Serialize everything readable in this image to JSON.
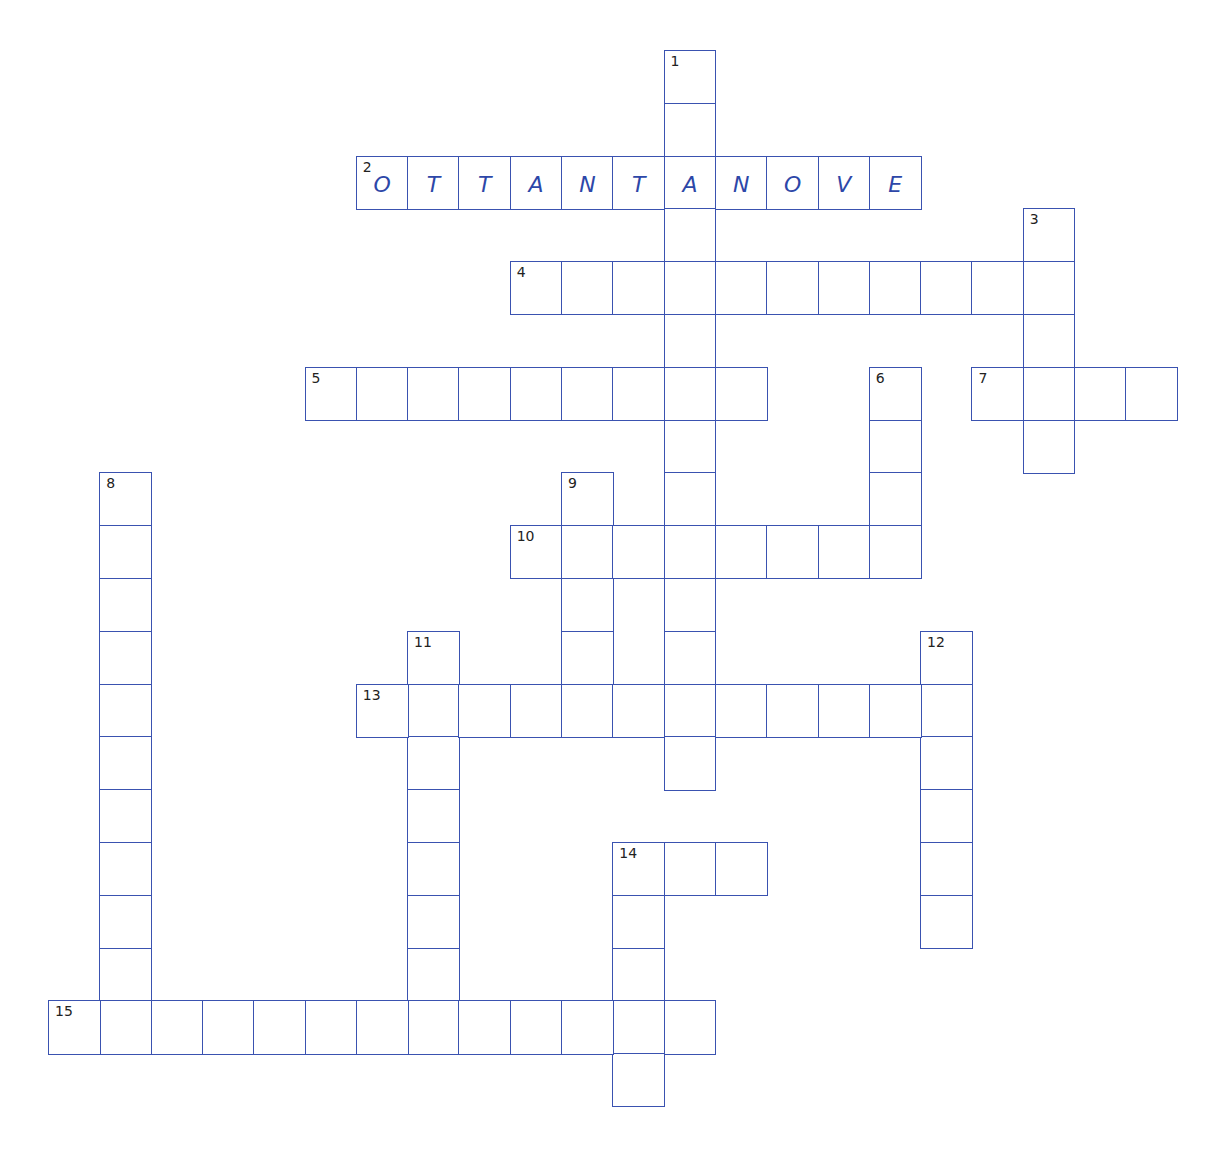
{
  "puzzle": {
    "grid": {
      "origin_x": 48,
      "origin_y": 50,
      "cell_w": 51.3,
      "cell_h": 52.8,
      "line_color": "#3a52b0",
      "letter_color": "#2d47a8"
    },
    "entries": [
      {
        "number": 1,
        "direction": "down",
        "row": 0,
        "col": 12,
        "length": 14,
        "answer": ""
      },
      {
        "number": 2,
        "direction": "across",
        "row": 2,
        "col": 6,
        "length": 11,
        "answer": "OTTANTANOVE"
      },
      {
        "number": 3,
        "direction": "down",
        "row": 3,
        "col": 19,
        "length": 5,
        "answer": ""
      },
      {
        "number": 4,
        "direction": "across",
        "row": 4,
        "col": 9,
        "length": 11,
        "answer": ""
      },
      {
        "number": 5,
        "direction": "across",
        "row": 6,
        "col": 5,
        "length": 9,
        "answer": ""
      },
      {
        "number": 6,
        "direction": "down",
        "row": 6,
        "col": 16,
        "length": 4,
        "answer": ""
      },
      {
        "number": 7,
        "direction": "across",
        "row": 6,
        "col": 18,
        "length": 4,
        "answer": ""
      },
      {
        "number": 8,
        "direction": "down",
        "row": 8,
        "col": 1,
        "length": 11,
        "answer": ""
      },
      {
        "number": 9,
        "direction": "down",
        "row": 8,
        "col": 10,
        "length": 5,
        "answer": ""
      },
      {
        "number": 10,
        "direction": "across",
        "row": 9,
        "col": 9,
        "length": 8,
        "answer": ""
      },
      {
        "number": 11,
        "direction": "down",
        "row": 11,
        "col": 7,
        "length": 8,
        "answer": ""
      },
      {
        "number": 12,
        "direction": "down",
        "row": 11,
        "col": 17,
        "length": 6,
        "answer": ""
      },
      {
        "number": 13,
        "direction": "across",
        "row": 12,
        "col": 6,
        "length": 12,
        "answer": ""
      },
      {
        "number": 14,
        "direction": "across",
        "row": 15,
        "col": 11,
        "length": 3,
        "answer": ""
      },
      {
        "number": 14,
        "direction": "down",
        "row": 15,
        "col": 11,
        "length": 5,
        "answer": ""
      },
      {
        "number": 15,
        "direction": "across",
        "row": 18,
        "col": 0,
        "length": 13,
        "answer": ""
      }
    ]
  }
}
